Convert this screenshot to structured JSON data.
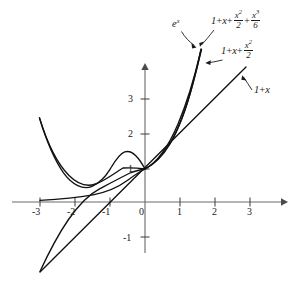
{
  "chart_data": {
    "type": "line",
    "title": "",
    "xlabel": "x",
    "ylabel": "y",
    "xlim": [
      -3.2,
      3.9
    ],
    "ylim": [
      -1.6,
      3.9
    ],
    "grid": false,
    "legend_position": "inline-annotations",
    "xticks": [
      "-3",
      "-2",
      "-1",
      "0",
      "1",
      "2",
      "3"
    ],
    "xtick_values": [
      -3,
      -2,
      -1,
      0,
      1,
      2,
      3
    ],
    "yticks": [
      "3",
      "2",
      "1",
      "0",
      "-1"
    ],
    "ytick_values": [
      3,
      2,
      1,
      0,
      -1
    ],
    "axis_color": "#6b6b6b",
    "curve_color": "#1a1a1a",
    "series": [
      {
        "name": "exp",
        "label_plain": "e^x",
        "formula": "e^x",
        "domain": [
          -3.0,
          1.62
        ],
        "description": "exponential function, passes through (0,1)"
      },
      {
        "name": "taylor1",
        "label_plain": "1 + x",
        "formula": "1+x",
        "domain": [
          -3.0,
          2.6
        ],
        "description": "first degree Taylor polynomial, straight line"
      },
      {
        "name": "taylor2",
        "label_plain": "1 + x + x^2/2",
        "formula": "1+x+x*x/2",
        "domain": [
          -3.0,
          1.72
        ],
        "description": "second degree Taylor polynomial, parabola with vertex at x=-1"
      },
      {
        "name": "taylor3",
        "label_plain": "1 + x + x^2/2 + x^3/6",
        "formula": "1+x+x*x/2+x*x*x/6",
        "domain": [
          -3.0,
          1.66
        ],
        "description": "third degree Taylor polynomial, cubic"
      }
    ]
  },
  "annotations": {
    "exp": {
      "base": "e",
      "exponent": "x"
    },
    "cubic": {
      "t1": "1",
      "plus1": "+",
      "t2": "x",
      "plus2": "+",
      "num1": "x",
      "num1_sup": "2",
      "den1": "2",
      "plus3": "+",
      "num2": "x",
      "num2_sup": "3",
      "den2": "6"
    },
    "quadratic": {
      "t1": "1",
      "plus1": "+",
      "t2": "x",
      "plus2": "+",
      "num1": "x",
      "num1_sup": "2",
      "den1": "2"
    },
    "linear": {
      "t1": "1",
      "plus1": "+",
      "t2": "x"
    }
  },
  "ticks": {
    "x": [
      {
        "label": "-3",
        "left": 32,
        "top": 207
      },
      {
        "label": "-2",
        "left": 67,
        "top": 207
      },
      {
        "label": "-1",
        "left": 102,
        "top": 207
      },
      {
        "label": "0",
        "left": 139,
        "top": 207
      },
      {
        "label": "1",
        "left": 177,
        "top": 207
      },
      {
        "label": "2",
        "left": 212,
        "top": 207
      },
      {
        "label": "3",
        "left": 247,
        "top": 207
      }
    ],
    "y": [
      {
        "label": "3",
        "left": 128,
        "top": 94
      },
      {
        "label": "2",
        "left": 128,
        "top": 129
      },
      {
        "label": "1",
        "left": 128,
        "top": 164
      },
      {
        "label": "-1",
        "left": 123,
        "top": 233
      }
    ]
  }
}
